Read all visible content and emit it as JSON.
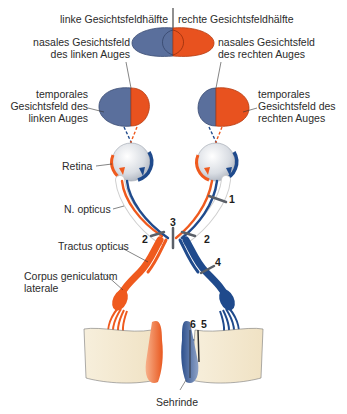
{
  "header": {
    "left_half": "linke Gesichtsfeldhälfte",
    "right_half": "rechte Gesichtsfeldhälfte"
  },
  "labels": {
    "nasal_left": [
      "nasales Gesichtsfeld",
      "des linken Auges"
    ],
    "nasal_right": [
      "nasales Gesichtsfeld",
      "des rechten Auges"
    ],
    "temporal_left": [
      "temporales",
      "Gesichtsfeld des",
      "linken Auges"
    ],
    "temporal_right": [
      "temporales",
      "Gesichtsfeld des",
      "rechten Auges"
    ],
    "retina": "Retina",
    "n_opticus": "N. opticus",
    "tractus_opticus": "Tractus opticus",
    "corpus_geniculatum": [
      "Corpus geniculatum",
      "laterale"
    ],
    "sehrinde": "Sehrinde"
  },
  "lesion_markers": [
    "1",
    "2",
    "2",
    "3",
    "4",
    "5",
    "6"
  ],
  "colors": {
    "left_field_blue": "#5a6f9c",
    "right_field_orange": "#e8521f",
    "nerve_blue": "#1f4a8c",
    "nerve_orange": "#ef5a1e",
    "cortex_beige": "#f4ead3",
    "eye_gray": "#dfe3e8"
  }
}
